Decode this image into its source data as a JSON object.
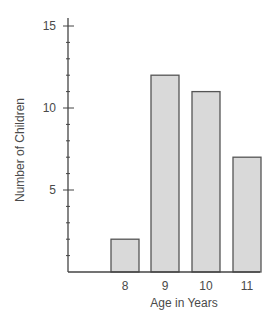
{
  "chart_data": {
    "type": "bar",
    "title": "",
    "categories": [
      "8",
      "9",
      "10",
      "11"
    ],
    "values": [
      2,
      12,
      11,
      7
    ],
    "xlabel": "Age in Years",
    "ylabel": "Number of Children",
    "ylim": [
      0,
      15
    ],
    "y_major_ticks": [
      5,
      10,
      15
    ],
    "y_minor_tick_step": 1,
    "grid": false,
    "legend": null,
    "colors": {
      "bar_fill": "#d9d9d9",
      "bar_stroke": "#555555",
      "axis": "#444444",
      "text": "#4a4a4a"
    }
  }
}
